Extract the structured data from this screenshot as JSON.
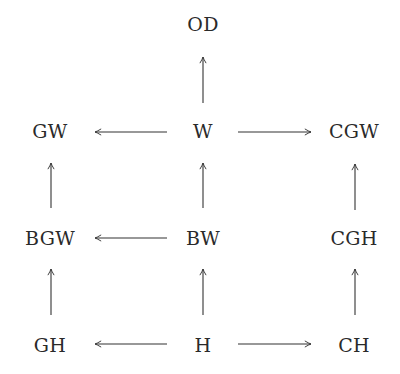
{
  "diagram": {
    "type": "commutative-diagram",
    "colors": {
      "text": "#2a2a2a",
      "arrow": "#333333",
      "background": "#ffffff"
    },
    "nodes": {
      "OD": {
        "label": "OD",
        "x": 203,
        "y": 24
      },
      "GW": {
        "label": "GW",
        "x": 50,
        "y": 131
      },
      "W": {
        "label": "W",
        "x": 203,
        "y": 131
      },
      "CGW": {
        "label": "CGW",
        "x": 354,
        "y": 131
      },
      "BGW": {
        "label": "BGW",
        "x": 50,
        "y": 238
      },
      "BW": {
        "label": "BW",
        "x": 203,
        "y": 238
      },
      "CGH": {
        "label": "CGH",
        "x": 354,
        "y": 238
      },
      "GH": {
        "label": "GH",
        "x": 50,
        "y": 345
      },
      "H": {
        "label": "H",
        "x": 203,
        "y": 345
      },
      "CH": {
        "label": "CH",
        "x": 354,
        "y": 345
      }
    },
    "edges": [
      {
        "from": "W",
        "to": "OD"
      },
      {
        "from": "W",
        "to": "GW"
      },
      {
        "from": "W",
        "to": "CGW"
      },
      {
        "from": "BGW",
        "to": "GW"
      },
      {
        "from": "BW",
        "to": "W"
      },
      {
        "from": "CGH",
        "to": "CGW"
      },
      {
        "from": "BW",
        "to": "BGW"
      },
      {
        "from": "GH",
        "to": "BGW"
      },
      {
        "from": "H",
        "to": "BW"
      },
      {
        "from": "CH",
        "to": "CGH"
      },
      {
        "from": "H",
        "to": "GH"
      },
      {
        "from": "H",
        "to": "CH"
      }
    ]
  }
}
